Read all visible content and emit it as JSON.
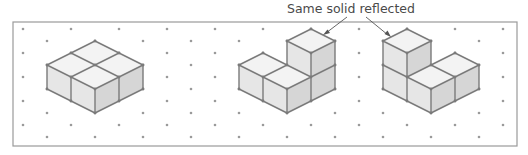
{
  "figure": {
    "annotation": {
      "text": "Same solid reflected",
      "arrows": [
        {
          "from": [
            347,
            17
          ],
          "to": [
            324,
            34
          ],
          "target": "solid-2"
        },
        {
          "from": [
            366,
            17
          ],
          "to": [
            390,
            36
          ],
          "target": "solid-3"
        }
      ]
    },
    "grid": {
      "type": "isometric-dot-paper",
      "columns": 21,
      "x_start": 23,
      "x_step": 24,
      "even_rows_y": [
        29,
        53,
        77,
        101,
        125
      ],
      "odd_rows_y": [
        41,
        65,
        89,
        113,
        137
      ]
    },
    "solids": [
      {
        "id": "solid-1",
        "description": "2x2 single-layer block of 4 cubes",
        "cube_count": 4
      },
      {
        "id": "solid-2",
        "description": "L-shaped solid: 2 cubes front-left row, 2 cubes stacked at back-right",
        "cube_count": 4
      },
      {
        "id": "solid-3",
        "description": "Reflection of solid-2: 2 cubes stacked at back-left, 2 cubes front-right row",
        "cube_count": 4
      }
    ],
    "colors": {
      "edge": "#7a7a7a",
      "top_face": "#f3f3f3",
      "left_face": "#e6e6e6",
      "right_face": "#d6d6d6",
      "dot": "#9a9a9a",
      "frame": "#9a9a9a",
      "text": "#4a4a4a"
    }
  }
}
